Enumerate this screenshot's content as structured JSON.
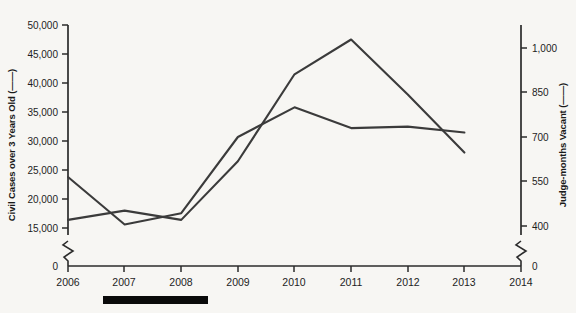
{
  "figure": {
    "background_color": "#f7f6f3",
    "line_color": "#3b3b3b",
    "axis_color": "#2b2b2b"
  },
  "left_axis": {
    "title": "Civil Cases over 3 Years Old (——)",
    "ticks": [
      "50,000",
      "45,000",
      "40,000",
      "35,000",
      "30,000",
      "25,000",
      "20,000",
      "15,000",
      "0"
    ],
    "tick_values": [
      50000,
      45000,
      40000,
      35000,
      30000,
      25000,
      20000,
      15000,
      0
    ],
    "has_break": true,
    "break_between": [
      "15,000",
      "0"
    ]
  },
  "right_axis": {
    "title": "Judge-months Vacant (——)",
    "ticks": [
      "1,000",
      "850",
      "700",
      "550",
      "400",
      "0"
    ],
    "tick_values": [
      1000,
      850,
      700,
      550,
      400,
      0
    ],
    "has_break": true,
    "break_between": [
      "400",
      "0"
    ]
  },
  "x_axis": {
    "ticks": [
      "2006",
      "2007",
      "2008",
      "2009",
      "2010",
      "2011",
      "2012",
      "2013",
      "2014"
    ]
  },
  "annotations": {
    "bottom_bar": "black-rule-under-2006-to-2008"
  },
  "chart_data": {
    "type": "line",
    "title": "",
    "xlabel": "",
    "ylabel": "Civil Cases over 3 Years Old (——)",
    "y2label": "Judge-months Vacant (——)",
    "x": [
      2006,
      2007,
      2008,
      2009,
      2010,
      2011,
      2012,
      2013,
      2014
    ],
    "categories": [
      "2006",
      "2007",
      "2008",
      "2009",
      "2010",
      "2011",
      "2012",
      "2013",
      "2014"
    ],
    "xlim": [
      2006,
      2014
    ],
    "ylim": [
      15000,
      50000
    ],
    "y2lim": [
      400,
      1000
    ],
    "grid": false,
    "legend": "inline-in-axis-titles",
    "series": [
      {
        "name": "Civil Cases over 3 Years Old",
        "axis": "left",
        "values": [
          16400,
          18000,
          16400,
          26500,
          41500,
          47500,
          38000,
          28000,
          null
        ]
      },
      {
        "name": "Judge-months Vacant",
        "axis": "right",
        "values": [
          565,
          405,
          443,
          700,
          800,
          730,
          735,
          715,
          null
        ]
      }
    ]
  }
}
